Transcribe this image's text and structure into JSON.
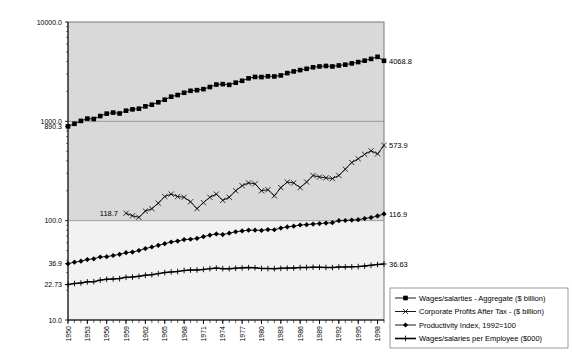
{
  "chart_data": {
    "type": "line",
    "title": "",
    "subtitle": "",
    "xlabel": "",
    "ylabel": "",
    "yscale": "log",
    "ylim": [
      10.0,
      10000.0
    ],
    "xlim": [
      1950,
      1999
    ],
    "grid": true,
    "plot_background": "#d9d9d9",
    "lower_band_background": "#f2f2f2",
    "legend_position": "bottom-right",
    "y_tick_labels": [
      "10000.0",
      "1000.0",
      "890.3",
      "100.0",
      "36.9",
      "22.73",
      "10.0"
    ],
    "y_tick_values": [
      10000.0,
      1000.0,
      890.3,
      100.0,
      36.9,
      22.73,
      10.0
    ],
    "x_tick_labels": [
      "1950",
      "1953",
      "1956",
      "1959",
      "1962",
      "1965",
      "1968",
      "1971",
      "1974",
      "1977",
      "1980",
      "1983",
      "1986",
      "1989",
      "1992",
      "1995",
      "1998"
    ],
    "x_tick_values": [
      1950,
      1953,
      1956,
      1959,
      1962,
      1965,
      1968,
      1971,
      1974,
      1977,
      1980,
      1983,
      1986,
      1989,
      1992,
      1995,
      1998
    ],
    "annotations": [
      {
        "text": "4068.8",
        "series": "Wages/salarties - Aggregate ($ billion)",
        "x": 1999,
        "y": 4068.8,
        "side": "right"
      },
      {
        "text": "573.9",
        "series": "Corporate Profits After Tax - ($ billion)",
        "x": 1999,
        "y": 573.9,
        "side": "right"
      },
      {
        "text": "116.9",
        "series": "Productivity Index, 1992=100",
        "x": 1999,
        "y": 116.9,
        "side": "right"
      },
      {
        "text": "36.63",
        "series": "Wages/salaries per Employee ($000)",
        "x": 1999,
        "y": 36.63,
        "side": "right"
      },
      {
        "text": "890.3",
        "series": "Wages/salarties - Aggregate ($ billion)",
        "x": 1950,
        "y": 890.3,
        "side": "left-axis"
      },
      {
        "text": "36.9",
        "series": "Productivity Index, 1992=100",
        "x": 1950,
        "y": 36.9,
        "side": "left-axis"
      },
      {
        "text": "22.73",
        "series": "Wages/salaries per Employee ($000)",
        "x": 1950,
        "y": 22.73,
        "side": "left-axis"
      },
      {
        "text": "118.7",
        "series": "Corporate Profits After Tax - ($ billion)",
        "x": 1959,
        "y": 118.7,
        "side": "inline"
      }
    ],
    "x": [
      1950,
      1951,
      1952,
      1953,
      1954,
      1955,
      1956,
      1957,
      1958,
      1959,
      1960,
      1961,
      1962,
      1963,
      1964,
      1965,
      1966,
      1967,
      1968,
      1969,
      1970,
      1971,
      1972,
      1973,
      1974,
      1975,
      1976,
      1977,
      1978,
      1979,
      1980,
      1981,
      1982,
      1983,
      1984,
      1985,
      1986,
      1987,
      1988,
      1989,
      1990,
      1991,
      1992,
      1993,
      1994,
      1995,
      1996,
      1997,
      1998,
      1999
    ],
    "series": [
      {
        "name": "Wages/salarties - Aggregate ($ billion)",
        "marker": "square",
        "color": "#000000",
        "values": [
          890.3,
          945,
          1010,
          1065,
          1055,
          1130,
          1195,
          1225,
          1200,
          1280,
          1320,
          1340,
          1415,
          1470,
          1555,
          1650,
          1770,
          1840,
          1940,
          2030,
          2060,
          2110,
          2215,
          2345,
          2370,
          2330,
          2450,
          2560,
          2710,
          2800,
          2790,
          2840,
          2830,
          2900,
          3060,
          3180,
          3280,
          3380,
          3500,
          3570,
          3610,
          3570,
          3650,
          3720,
          3830,
          3950,
          4080,
          4250,
          4460,
          4068.8
        ]
      },
      {
        "name": "Corporate Profits After Tax - ($ billion)",
        "marker": "x",
        "color": "#000000",
        "values": [
          null,
          null,
          null,
          null,
          null,
          null,
          null,
          null,
          null,
          118.7,
          112,
          108,
          125,
          132,
          150,
          175,
          185,
          175,
          172,
          155,
          132,
          152,
          172,
          185,
          160,
          172,
          200,
          225,
          240,
          235,
          200,
          205,
          178,
          215,
          245,
          240,
          215,
          245,
          285,
          275,
          270,
          265,
          285,
          330,
          385,
          420,
          465,
          505,
          470,
          573.9
        ]
      },
      {
        "name": "Productivity Index, 1992=100",
        "marker": "diamond",
        "color": "#000000",
        "values": [
          36.9,
          38.2,
          39.1,
          40.6,
          41.3,
          43.1,
          43.4,
          44.6,
          45.8,
          47.6,
          48.3,
          50.1,
          52.4,
          54.3,
          56.4,
          58.6,
          61.0,
          62.3,
          64.5,
          65.0,
          66.3,
          69.0,
          71.4,
          73.6,
          72.5,
          74.8,
          77.3,
          78.9,
          80.3,
          80.2,
          79.8,
          81.4,
          81.0,
          84.2,
          86.5,
          88.0,
          90.4,
          91.2,
          92.5,
          93.5,
          94.6,
          95.4,
          100.0,
          100.4,
          101.4,
          102.3,
          105.1,
          107.5,
          111.5,
          116.9
        ]
      },
      {
        "name": "Wages/salaries per Employee ($000)",
        "marker": "plus",
        "color": "#000000",
        "values": [
          22.73,
          23.3,
          23.6,
          24.2,
          24.3,
          25.2,
          25.7,
          25.9,
          26.1,
          26.9,
          27.1,
          27.5,
          28.2,
          28.6,
          29.3,
          30.0,
          30.5,
          30.8,
          31.5,
          31.8,
          31.9,
          32.3,
          32.9,
          33.3,
          32.9,
          32.8,
          33.2,
          33.5,
          33.7,
          33.6,
          33.0,
          33.0,
          32.9,
          33.1,
          33.3,
          33.4,
          33.7,
          33.8,
          34.0,
          33.9,
          33.8,
          33.7,
          34.2,
          34.2,
          34.3,
          34.5,
          34.9,
          35.5,
          36.2,
          36.63
        ]
      }
    ],
    "legend": [
      {
        "label": "Wages/salarties - Aggregate ($ billion)",
        "marker": "square"
      },
      {
        "label": "Corporate Profits After Tax - ($ billion)",
        "marker": "x"
      },
      {
        "label": "Productivity Index, 1992=100",
        "marker": "diamond"
      },
      {
        "label": "Wages/salaries per Employee ($000)",
        "marker": "plus"
      }
    ]
  }
}
